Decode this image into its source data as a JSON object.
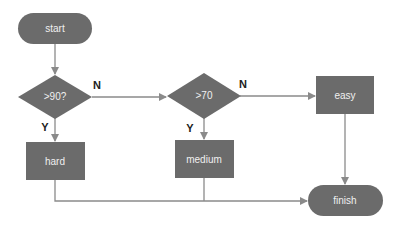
{
  "diagram": {
    "type": "flowchart",
    "colors": {
      "node_fill": "#6b6b6b",
      "edge": "#8a8a8a",
      "node_text": "#f0f0f0",
      "label_text": "#222222"
    },
    "nodes": {
      "start": {
        "label": "start",
        "shape": "terminal"
      },
      "decision_90": {
        "label": ">90?",
        "shape": "diamond"
      },
      "decision_70": {
        "label": ">70",
        "shape": "diamond"
      },
      "easy": {
        "label": "easy",
        "shape": "process"
      },
      "hard": {
        "label": "hard",
        "shape": "process"
      },
      "medium": {
        "label": "medium",
        "shape": "process"
      },
      "finish": {
        "label": "finish",
        "shape": "terminal"
      }
    },
    "edges": [
      {
        "from": "start",
        "to": "decision_90",
        "label": ""
      },
      {
        "from": "decision_90",
        "to": "decision_70",
        "label": "N"
      },
      {
        "from": "decision_90",
        "to": "hard",
        "label": "Y"
      },
      {
        "from": "decision_70",
        "to": "easy",
        "label": "N"
      },
      {
        "from": "decision_70",
        "to": "medium",
        "label": "Y"
      },
      {
        "from": "easy",
        "to": "finish",
        "label": ""
      },
      {
        "from": "hard",
        "to": "finish",
        "label": ""
      },
      {
        "from": "medium",
        "to": "finish",
        "label": ""
      }
    ],
    "edge_labels": {
      "n1": "N",
      "y1": "Y",
      "n2": "N",
      "y2": "Y"
    }
  }
}
